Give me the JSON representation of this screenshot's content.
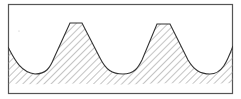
{
  "diagram": {
    "type": "thread-profile-section",
    "frame": {
      "x": 8,
      "y": 4,
      "width": 225,
      "height": 90
    },
    "profile": {
      "crests": [
        {
          "x_start": 70,
          "x_end": 82,
          "y": 23
        },
        {
          "x_start": 157,
          "x_end": 170,
          "y": 24
        }
      ],
      "roots": [
        {
          "x": 35,
          "y": 74
        },
        {
          "x": 123,
          "y": 74
        },
        {
          "x": 210,
          "y": 74
        }
      ],
      "left_edge_y": 47,
      "right_edge_y": 46,
      "hatch_bottom_y": 84
    },
    "colors": {
      "line": "#333333",
      "hatch": "#8a8a8a",
      "frame": "#555555",
      "background": "#ffffff"
    }
  }
}
